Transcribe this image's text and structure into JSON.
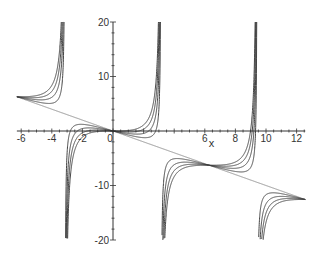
{
  "chart_data": {
    "type": "line",
    "title": "",
    "xlabel": "x",
    "ylabel": "",
    "function": "y = -x + a*tan(x/2)",
    "parameter_values": [
      0,
      0.5,
      1,
      1.5,
      2
    ],
    "x_domain": [
      -6.2832,
      12.5664
    ],
    "xlim": [
      -6.2832,
      12.5664
    ],
    "ylim": [
      -20,
      20
    ],
    "vertical_asymptotes": [
      -3.1416,
      3.1416,
      9.4248
    ],
    "x_ticks": [
      -6,
      -4,
      -2,
      0,
      6,
      8,
      10,
      12
    ],
    "x_tick_labels": [
      "-6",
      "-4",
      "-2",
      "0",
      "6",
      "8",
      "10",
      "12"
    ],
    "y_ticks": [
      20,
      10,
      -10,
      -20
    ],
    "y_tick_labels": [
      "20",
      "10",
      "-10",
      "-20"
    ],
    "grid": false,
    "legend": "none",
    "series": [
      {
        "name": "a=0",
        "a": 0
      },
      {
        "name": "a=0.5",
        "a": 0.5
      },
      {
        "name": "a=1",
        "a": 1
      },
      {
        "name": "a=1.5",
        "a": 1.5
      },
      {
        "name": "a=2",
        "a": 2
      }
    ],
    "line_color": "#444444"
  }
}
